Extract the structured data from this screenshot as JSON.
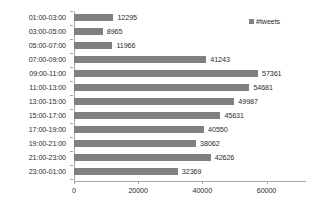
{
  "chart_data": {
    "type": "bar",
    "orientation": "horizontal",
    "title": "",
    "xlabel": "",
    "ylabel": "",
    "categories": [
      "01:00-03:00",
      "03:00-05:00",
      "05:00-07:00",
      "07:00-09:00",
      "09:00-11:00",
      "11:00-13:00",
      "13:00-15:00",
      "15:00-17:00",
      "17:00-19:00",
      "19:00-21:00",
      "21:00-23:00",
      "23:00-01:00"
    ],
    "values": [
      12295,
      8965,
      11966,
      41243,
      57361,
      54681,
      49987,
      45631,
      40550,
      38062,
      42626,
      32369
    ],
    "series": [
      {
        "name": "#tweets",
        "values": [
          12295,
          8965,
          11966,
          41243,
          57361,
          54681,
          49987,
          45631,
          40550,
          38062,
          42626,
          32369
        ],
        "color": "#808080"
      }
    ],
    "data_labels": [
      "12295",
      "8965",
      "11966",
      "41243",
      "57361",
      "54681",
      "49987",
      "45631",
      "40550",
      "38062",
      "42626",
      "32369"
    ],
    "xticks": [
      0,
      20000,
      40000,
      60000
    ],
    "xtick_labels": [
      "0",
      "20000",
      "40000",
      "60000"
    ],
    "xlim": [
      0,
      72000
    ],
    "grid": false,
    "legend": {
      "position": "top-right",
      "entries": [
        {
          "label": "#tweets",
          "color": "#808080"
        }
      ]
    },
    "axis_color": "#a6a6a6",
    "text_color": "#2b2b2b",
    "background": "#ffffff"
  }
}
